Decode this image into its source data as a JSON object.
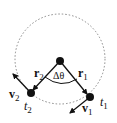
{
  "diagram": {
    "type": "circular-motion",
    "labels": {
      "r1": "r",
      "r1_sub": "1",
      "r2": "r",
      "r2_sub": "2",
      "v1": "v",
      "v1_sub": "1",
      "v2": "v",
      "v2_sub": "2",
      "t1": "t",
      "t1_sub": "1",
      "t2": "t",
      "t2_sub": "2",
      "angle": "Δθ"
    },
    "colors": {
      "ink": "#111111",
      "dashed_circle": "#888888",
      "background": "#ffffff"
    }
  }
}
